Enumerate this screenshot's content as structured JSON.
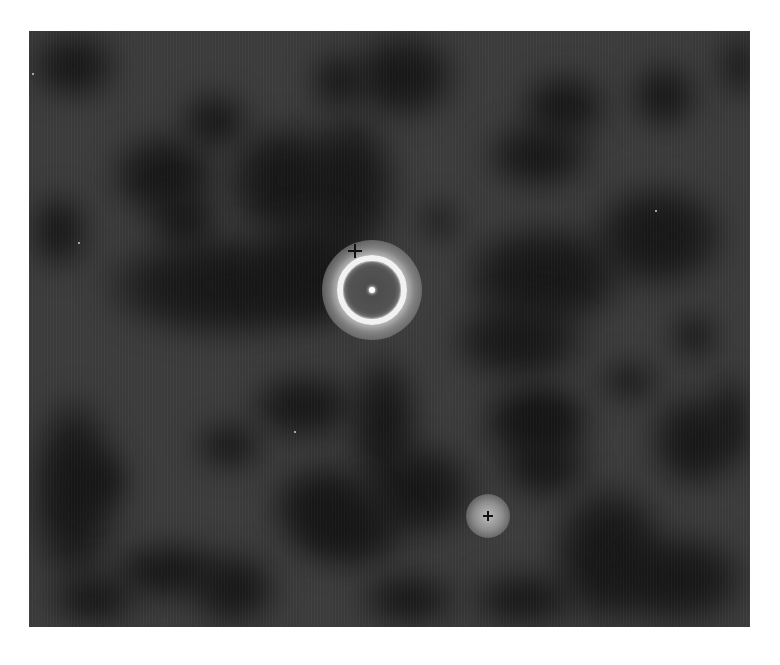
{
  "image": {
    "description": "Grayscale astronomical image: bright ring nebula with central star, secondary glowing source, mottled dark clouds",
    "colors": {
      "background": "#3d3d3d",
      "dark_cloud": "#161616",
      "ring": "#f2f2f2",
      "halo": "#8a8a8a",
      "inner_disk": "#555555",
      "central_star": "#ffffff",
      "secondary_source": "#bcbcbc",
      "marker": "#111111",
      "page_background": "#ffffff"
    },
    "frame": {
      "x": 29,
      "y": 31,
      "width": 721,
      "height": 596
    },
    "ring_nebula": {
      "cx": 372,
      "cy": 290,
      "ring_radius": 32,
      "halo_radius": 50
    },
    "secondary_source": {
      "cx": 488,
      "cy": 516,
      "radius": 22
    },
    "markers": [
      {
        "name": "cross-marker-ring",
        "x": 355,
        "y": 251,
        "size": 14
      },
      {
        "name": "cross-marker-source",
        "x": 488,
        "y": 516,
        "size": 10
      }
    ],
    "faint_stars": [
      {
        "x": 79,
        "y": 243
      },
      {
        "x": 295,
        "y": 432
      },
      {
        "x": 656,
        "y": 211
      },
      {
        "x": 33,
        "y": 74
      }
    ],
    "dark_clouds": [
      {
        "x": 0,
        "y": 0,
        "w": 90,
        "h": 70
      },
      {
        "x": 80,
        "y": 100,
        "w": 110,
        "h": 90
      },
      {
        "x": 150,
        "y": 60,
        "w": 70,
        "h": 60
      },
      {
        "x": 195,
        "y": 90,
        "w": 120,
        "h": 120
      },
      {
        "x": 270,
        "y": 80,
        "w": 100,
        "h": 150
      },
      {
        "x": 120,
        "y": 160,
        "w": 70,
        "h": 60
      },
      {
        "x": 0,
        "y": 160,
        "w": 60,
        "h": 80
      },
      {
        "x": 70,
        "y": 200,
        "w": 260,
        "h": 110
      },
      {
        "x": 225,
        "y": 180,
        "w": 120,
        "h": 120
      },
      {
        "x": 320,
        "y": 0,
        "w": 110,
        "h": 90
      },
      {
        "x": 280,
        "y": 20,
        "w": 60,
        "h": 60
      },
      {
        "x": 490,
        "y": 40,
        "w": 90,
        "h": 70
      },
      {
        "x": 455,
        "y": 90,
        "w": 110,
        "h": 70
      },
      {
        "x": 600,
        "y": 30,
        "w": 70,
        "h": 70
      },
      {
        "x": 690,
        "y": 0,
        "w": 40,
        "h": 70
      },
      {
        "x": 390,
        "y": 170,
        "w": 40,
        "h": 40
      },
      {
        "x": 430,
        "y": 190,
        "w": 170,
        "h": 110
      },
      {
        "x": 560,
        "y": 150,
        "w": 140,
        "h": 110
      },
      {
        "x": 420,
        "y": 270,
        "w": 140,
        "h": 80
      },
      {
        "x": 0,
        "y": 360,
        "w": 90,
        "h": 200
      },
      {
        "x": 40,
        "y": 420,
        "w": 60,
        "h": 60
      },
      {
        "x": 220,
        "y": 340,
        "w": 110,
        "h": 70
      },
      {
        "x": 320,
        "y": 320,
        "w": 70,
        "h": 140
      },
      {
        "x": 165,
        "y": 390,
        "w": 70,
        "h": 50
      },
      {
        "x": 330,
        "y": 410,
        "w": 120,
        "h": 100
      },
      {
        "x": 240,
        "y": 430,
        "w": 110,
        "h": 90
      },
      {
        "x": 260,
        "y": 460,
        "w": 120,
        "h": 80
      },
      {
        "x": 80,
        "y": 510,
        "w": 120,
        "h": 60
      },
      {
        "x": 20,
        "y": 540,
        "w": 90,
        "h": 56
      },
      {
        "x": 160,
        "y": 520,
        "w": 90,
        "h": 76
      },
      {
        "x": 330,
        "y": 540,
        "w": 100,
        "h": 56
      },
      {
        "x": 450,
        "y": 350,
        "w": 110,
        "h": 80
      },
      {
        "x": 480,
        "y": 360,
        "w": 70,
        "h": 60
      },
      {
        "x": 570,
        "y": 330,
        "w": 60,
        "h": 40
      },
      {
        "x": 470,
        "y": 400,
        "w": 90,
        "h": 70
      },
      {
        "x": 680,
        "y": 340,
        "w": 41,
        "h": 100
      },
      {
        "x": 620,
        "y": 360,
        "w": 90,
        "h": 100
      },
      {
        "x": 520,
        "y": 450,
        "w": 120,
        "h": 146
      },
      {
        "x": 580,
        "y": 500,
        "w": 140,
        "h": 96
      },
      {
        "x": 440,
        "y": 540,
        "w": 110,
        "h": 56
      },
      {
        "x": 640,
        "y": 280,
        "w": 50,
        "h": 50
      }
    ]
  },
  "caption": {
    "text": ""
  }
}
